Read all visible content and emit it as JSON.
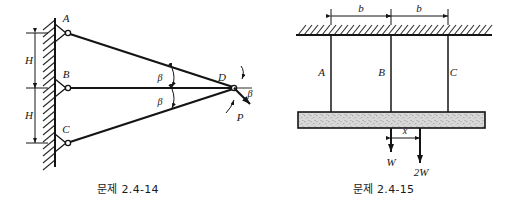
{
  "page": {
    "width": 511,
    "height": 207,
    "background": "#ffffff",
    "ink": "#141414",
    "hatch_color": "#2a2a2a",
    "bar_fill": "#d8d8d8"
  },
  "figures": [
    {
      "id": "fig-2-4-14",
      "caption": "문제 2.4-14",
      "description": "Three pin-connected bars AD, BD, CD attached to a vertical wall and meeting at joint D, loaded by force P at angle beta below horizontal",
      "support": {
        "type": "fixed-wall",
        "orientation": "vertical",
        "hatch_side": "left"
      },
      "joints": [
        {
          "name": "A",
          "label": "A",
          "x": 68,
          "y": 33,
          "type": "pin"
        },
        {
          "name": "B",
          "label": "B",
          "x": 68,
          "y": 88,
          "type": "pin"
        },
        {
          "name": "C",
          "label": "C",
          "x": 68,
          "y": 143,
          "type": "pin"
        },
        {
          "name": "D",
          "label": "D",
          "x": 234,
          "y": 88,
          "type": "free"
        }
      ],
      "members": [
        {
          "name": "AD",
          "from": "A",
          "to": "D"
        },
        {
          "name": "BD",
          "from": "B",
          "to": "D"
        },
        {
          "name": "CD",
          "from": "C",
          "to": "D"
        }
      ],
      "dimensions": [
        {
          "name": "H-upper",
          "label": "H",
          "from_y": 33,
          "to_y": 88
        },
        {
          "name": "H-lower",
          "label": "H",
          "from_y": 88,
          "to_y": 143
        }
      ],
      "angles": [
        {
          "name": "beta-upper",
          "label": "β",
          "between": "AD and BD"
        },
        {
          "name": "beta-lower",
          "label": "β",
          "between": "BD and CD"
        },
        {
          "name": "beta-load",
          "label": "β",
          "between": "horizontal and P"
        }
      ],
      "load": {
        "name": "P",
        "label": "P",
        "applied_at": "D",
        "direction": "down-right at angle beta below horizontal"
      }
    },
    {
      "id": "fig-2-4-15",
      "caption": "문제 2.4-15",
      "description": "Rigid bar suspended from a ceiling by three vertical rods A, B, C spaced distance b apart, carrying loads W and 2W",
      "support": {
        "type": "fixed-ceiling",
        "orientation": "horizontal",
        "hatch_side": "above"
      },
      "rods": [
        {
          "name": "A",
          "label": "A",
          "x": 331
        },
        {
          "name": "B",
          "label": "B",
          "x": 391
        },
        {
          "name": "C",
          "label": "C",
          "x": 448
        }
      ],
      "bar": {
        "name": "rigid-bar",
        "left": 298,
        "right": 485,
        "top": 112,
        "height": 16
      },
      "dimensions": [
        {
          "name": "b-left",
          "label": "b",
          "from": "A",
          "to": "B"
        },
        {
          "name": "b-right",
          "label": "b",
          "from": "B",
          "to": "C"
        },
        {
          "name": "x-offset",
          "label": "x",
          "from": "W",
          "to": "2W"
        }
      ],
      "loads": [
        {
          "name": "W",
          "label": "W",
          "x": 391,
          "direction": "down"
        },
        {
          "name": "2W",
          "label": "2W",
          "x": 420,
          "direction": "down"
        }
      ]
    }
  ]
}
